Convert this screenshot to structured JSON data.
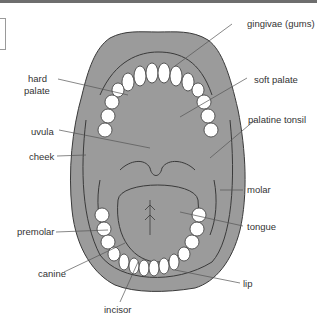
{
  "figure": {
    "colors": {
      "tissue": "#9b9b9b",
      "outline": "#3a3a3a",
      "teeth": "#ffffff",
      "leader": "#555555"
    }
  },
  "labels": {
    "gingivae": "gingivae (gums)",
    "hard_palate_1": "hard",
    "hard_palate_2": "palate",
    "soft_palate": "soft palate",
    "uvula": "uvula",
    "palatine_tonsil": "palatine tonsil",
    "cheek": "cheek",
    "molar": "molar",
    "tongue": "tongue",
    "premolar": "premolar",
    "canine": "canine",
    "lip": "lip",
    "incisor": "incisor"
  }
}
